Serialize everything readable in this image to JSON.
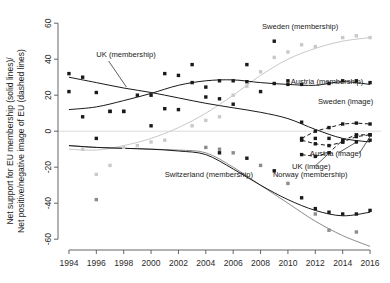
{
  "chart_data": {
    "type": "scatter",
    "title": "",
    "xlabel": "",
    "ylabel_line1": "Net support for EU membership (solid lines)/",
    "ylabel_line2": "Net positive/negative image of EU (dashed lines)",
    "xlim": [
      1993.2,
      2016.8
    ],
    "ylim": [
      -66,
      64
    ],
    "xticks": [
      1994,
      1996,
      1998,
      2000,
      2002,
      2004,
      2006,
      2008,
      2010,
      2012,
      2014,
      2016
    ],
    "yticks": [
      60,
      40,
      20,
      0,
      -20,
      -40,
      -60
    ],
    "grid": false,
    "legend_position": "inline-annotations",
    "zero_line": true,
    "annotations": [
      {
        "id": "uk-membership",
        "text": "UK (membership)",
        "x": 1996.0,
        "y": 41.0,
        "anchor": "start"
      },
      {
        "id": "sweden-membership",
        "text": "Sweden (membership)",
        "x": 2008.1,
        "y": 57.0,
        "anchor": "start"
      },
      {
        "id": "austria-membership",
        "text": "Austria (membership)",
        "x": 2010.2,
        "y": 26.5,
        "anchor": "start"
      },
      {
        "id": "sweden-image",
        "text": "Sweden (image)",
        "x": 2012.2,
        "y": 15.0,
        "anchor": "start"
      },
      {
        "id": "austria-image",
        "text": "Austria (image)",
        "x": 2011.6,
        "y": -14.0,
        "anchor": "start"
      },
      {
        "id": "uk-image",
        "text": "UK (image)",
        "x": 2010.3,
        "y": -21.0,
        "anchor": "start"
      },
      {
        "id": "switzerland-membership",
        "text": "Switzerland (membership)",
        "x": 2001.0,
        "y": -25.5,
        "anchor": "start"
      },
      {
        "id": "norway-membership",
        "text": "Norway (membership)",
        "x": 2008.9,
        "y": -25.5,
        "anchor": "start"
      }
    ],
    "colors": {
      "dark": "#1a1a1a",
      "mid_grey": "#8c8c8c",
      "light_grey": "#c9c9c9",
      "axis": "#555555",
      "zero_line": "#d7d7d7"
    },
    "series": [
      {
        "name": "UK (membership)",
        "style": "solid",
        "color": "#1a1a1a",
        "marker": "filled-square-dark",
        "fit": [
          {
            "x": 1994,
            "y": 30.0
          },
          {
            "x": 1996,
            "y": 27.0
          },
          {
            "x": 1998,
            "y": 24.0
          },
          {
            "x": 2000,
            "y": 21.5
          },
          {
            "x": 2002,
            "y": 18.5
          },
          {
            "x": 2004,
            "y": 15.5
          },
          {
            "x": 2006,
            "y": 13.0
          },
          {
            "x": 2008,
            "y": 10.5
          },
          {
            "x": 2010,
            "y": 7.0
          },
          {
            "x": 2012,
            "y": 1.0
          },
          {
            "x": 2014,
            "y": -4.0
          },
          {
            "x": 2016,
            "y": -6.0
          }
        ],
        "points": [
          {
            "x": 1994,
            "y": 32.0
          },
          {
            "x": 1994,
            "y": 22.0
          },
          {
            "x": 1995,
            "y": 30.0
          },
          {
            "x": 1996,
            "y": 21.5
          },
          {
            "x": 1997,
            "y": 11.0
          },
          {
            "x": 1998,
            "y": 11.0
          },
          {
            "x": 1999,
            "y": 20.0
          },
          {
            "x": 2000,
            "y": 3.0
          },
          {
            "x": 2001,
            "y": 32.0
          },
          {
            "x": 2002,
            "y": 31.0
          },
          {
            "x": 2003,
            "y": 27.0
          },
          {
            "x": 2004,
            "y": 19.0
          },
          {
            "x": 2005,
            "y": 18.0
          },
          {
            "x": 2006,
            "y": 15.0
          },
          {
            "x": 2007,
            "y": 37.0
          },
          {
            "x": 2008,
            "y": 22.0
          },
          {
            "x": 2009,
            "y": 50.0
          },
          {
            "x": 2010,
            "y": 28.0
          },
          {
            "x": 2011,
            "y": 5.0
          },
          {
            "x": 2012,
            "y": -4.0
          },
          {
            "x": 2013,
            "y": -4.0
          },
          {
            "x": 2014,
            "y": -6.0
          },
          {
            "x": 2015,
            "y": -6.0
          },
          {
            "x": 2016,
            "y": -5.0
          }
        ]
      },
      {
        "name": "Austria (membership)",
        "style": "solid",
        "color": "#1a1a1a",
        "marker": "filled-square-dark",
        "fit": [
          {
            "x": 1994,
            "y": 12.0
          },
          {
            "x": 1996,
            "y": 13.5
          },
          {
            "x": 1998,
            "y": 17.0
          },
          {
            "x": 2000,
            "y": 21.0
          },
          {
            "x": 2002,
            "y": 25.5
          },
          {
            "x": 2004,
            "y": 28.0
          },
          {
            "x": 2006,
            "y": 28.5
          },
          {
            "x": 2008,
            "y": 27.0
          },
          {
            "x": 2010,
            "y": 26.0
          },
          {
            "x": 2012,
            "y": 25.5
          },
          {
            "x": 2014,
            "y": 27.5
          },
          {
            "x": 2016,
            "y": 26.0
          }
        ],
        "points": [
          {
            "x": 1995,
            "y": 8.0
          },
          {
            "x": 1996,
            "y": -4.0
          },
          {
            "x": 1997,
            "y": 11.0
          },
          {
            "x": 1998,
            "y": 11.0
          },
          {
            "x": 2000,
            "y": 20.0
          },
          {
            "x": 2001,
            "y": 12.5
          },
          {
            "x": 2002,
            "y": 12.0
          },
          {
            "x": 2003,
            "y": 37.0
          },
          {
            "x": 2004,
            "y": 24.5
          },
          {
            "x": 2005,
            "y": 28.0
          },
          {
            "x": 2006,
            "y": 28.0
          },
          {
            "x": 2007,
            "y": 27.5
          },
          {
            "x": 2009,
            "y": 26.5
          },
          {
            "x": 2010,
            "y": 26.0
          },
          {
            "x": 2011,
            "y": 26.0
          },
          {
            "x": 2013,
            "y": 26.5
          },
          {
            "x": 2014,
            "y": 28.0
          },
          {
            "x": 2015,
            "y": 28.0
          },
          {
            "x": 2016,
            "y": 27.0
          }
        ]
      },
      {
        "name": "Sweden (membership)",
        "style": "solid",
        "color": "#c9c9c9",
        "marker": "filled-square-light",
        "fit": [
          {
            "x": 1994,
            "y": -10.0
          },
          {
            "x": 1996,
            "y": -10.5
          },
          {
            "x": 1998,
            "y": -8.0
          },
          {
            "x": 2000,
            "y": -4.0
          },
          {
            "x": 2002,
            "y": 2.0
          },
          {
            "x": 2004,
            "y": 10.0
          },
          {
            "x": 2006,
            "y": 20.0
          },
          {
            "x": 2008,
            "y": 31.0
          },
          {
            "x": 2010,
            "y": 40.0
          },
          {
            "x": 2012,
            "y": 46.0
          },
          {
            "x": 2014,
            "y": 50.0
          },
          {
            "x": 2016,
            "y": 52.0
          }
        ],
        "points": [
          {
            "x": 1995,
            "y": -10.0
          },
          {
            "x": 1996,
            "y": -24.0
          },
          {
            "x": 1997,
            "y": -19.0
          },
          {
            "x": 1998,
            "y": -9.0
          },
          {
            "x": 1999,
            "y": -8.0
          },
          {
            "x": 2000,
            "y": -6.0
          },
          {
            "x": 2001,
            "y": -5.0
          },
          {
            "x": 2003,
            "y": 3.0
          },
          {
            "x": 2004,
            "y": 6.0
          },
          {
            "x": 2005,
            "y": 8.0
          },
          {
            "x": 2006,
            "y": 20.0
          },
          {
            "x": 2007,
            "y": 25.0
          },
          {
            "x": 2008,
            "y": 33.0
          },
          {
            "x": 2009,
            "y": 41.0
          },
          {
            "x": 2010,
            "y": 44.0
          },
          {
            "x": 2011,
            "y": 48.0
          },
          {
            "x": 2012,
            "y": 47.0
          },
          {
            "x": 2014,
            "y": 52.0
          },
          {
            "x": 2015,
            "y": 53.0
          },
          {
            "x": 2016,
            "y": 52.0
          }
        ]
      },
      {
        "name": "Switzerland (membership)",
        "style": "solid",
        "color": "#8c8c8c",
        "marker": "filled-square-mid",
        "fit": [
          {
            "x": 1994,
            "y": -8.0
          },
          {
            "x": 1996,
            "y": -9.0
          },
          {
            "x": 1998,
            "y": -9.5
          },
          {
            "x": 2000,
            "y": -10.0
          },
          {
            "x": 2002,
            "y": -10.5
          },
          {
            "x": 2004,
            "y": -12.0
          },
          {
            "x": 2006,
            "y": -20.0
          },
          {
            "x": 2008,
            "y": -30.0
          },
          {
            "x": 2010,
            "y": -40.0
          },
          {
            "x": 2012,
            "y": -50.0
          },
          {
            "x": 2014,
            "y": -58.0
          },
          {
            "x": 2016,
            "y": -64.0
          }
        ],
        "points": [
          {
            "x": 1996,
            "y": -38.0
          },
          {
            "x": 2004,
            "y": -9.0
          },
          {
            "x": 2005,
            "y": -10.0
          },
          {
            "x": 2006,
            "y": -12.0
          },
          {
            "x": 2008,
            "y": -19.0
          },
          {
            "x": 2010,
            "y": -29.0
          },
          {
            "x": 2012,
            "y": -46.0
          },
          {
            "x": 2013,
            "y": -55.0
          },
          {
            "x": 2015,
            "y": -56.0
          }
        ]
      },
      {
        "name": "Norway (membership)",
        "style": "solid",
        "color": "#1a1a1a",
        "marker": "filled-square-dark",
        "fit": [
          {
            "x": 1994,
            "y": -8.0
          },
          {
            "x": 1996,
            "y": -9.0
          },
          {
            "x": 1998,
            "y": -9.5
          },
          {
            "x": 2000,
            "y": -10.0
          },
          {
            "x": 2002,
            "y": -11.0
          },
          {
            "x": 2004,
            "y": -13.0
          },
          {
            "x": 2006,
            "y": -21.0
          },
          {
            "x": 2008,
            "y": -30.0
          },
          {
            "x": 2010,
            "y": -38.0
          },
          {
            "x": 2012,
            "y": -44.0
          },
          {
            "x": 2014,
            "y": -47.0
          },
          {
            "x": 2016,
            "y": -45.0
          }
        ],
        "points": [
          {
            "x": 2005,
            "y": -12.0
          },
          {
            "x": 2007,
            "y": -15.0
          },
          {
            "x": 2009,
            "y": -22.0
          },
          {
            "x": 2011,
            "y": -37.0
          },
          {
            "x": 2012,
            "y": -43.0
          },
          {
            "x": 2013,
            "y": -45.0
          },
          {
            "x": 2014,
            "y": -46.0
          },
          {
            "x": 2015,
            "y": -46.0
          },
          {
            "x": 2016,
            "y": -44.0
          }
        ]
      },
      {
        "name": "UK (image)",
        "style": "dashed",
        "color": "#1a1a1a",
        "marker": "filled-square-dark",
        "points": [
          {
            "x": 2011,
            "y": -13.0
          },
          {
            "x": 2012,
            "y": -14.0
          },
          {
            "x": 2013,
            "y": -12.0
          },
          {
            "x": 2014,
            "y": -5.0
          },
          {
            "x": 2015,
            "y": -2.0
          },
          {
            "x": 2016,
            "y": -2.0
          }
        ]
      },
      {
        "name": "Austria (image)",
        "style": "dashed",
        "color": "#1a1a1a",
        "marker": "filled-square-dark",
        "points": [
          {
            "x": 2011,
            "y": -5.0
          },
          {
            "x": 2012,
            "y": -7.0
          },
          {
            "x": 2013,
            "y": -8.0
          },
          {
            "x": 2014,
            "y": -6.0
          },
          {
            "x": 2015,
            "y": -3.0
          },
          {
            "x": 2016,
            "y": -2.0
          }
        ]
      },
      {
        "name": "Sweden (image)",
        "style": "dashed",
        "color": "#1a1a1a",
        "marker": "filled-square-dark",
        "points": [
          {
            "x": 2011,
            "y": -4.0
          },
          {
            "x": 2012,
            "y": 0.0
          },
          {
            "x": 2013,
            "y": 2.0
          },
          {
            "x": 2014,
            "y": 4.0
          },
          {
            "x": 2015,
            "y": 4.5
          },
          {
            "x": 2016,
            "y": 4.0
          }
        ]
      }
    ],
    "callout_leaders": [
      {
        "id": "uk-membership-leader",
        "x1": 1996.9,
        "y1": 39.0,
        "x2": 1998.2,
        "y2": 24.5
      },
      {
        "id": "austria-image-leader",
        "x1": 2013.7,
        "y1": -12.0,
        "x2": 2014.9,
        "y2": -6.5
      },
      {
        "id": "austria-image-leader-2",
        "x1": 2015.2,
        "y1": -12.5,
        "x2": 2016.0,
        "y2": -3.0
      },
      {
        "id": "uk-image-leader",
        "x1": 2011.9,
        "y1": -20.0,
        "x2": 2012.9,
        "y2": -13.0
      }
    ]
  }
}
